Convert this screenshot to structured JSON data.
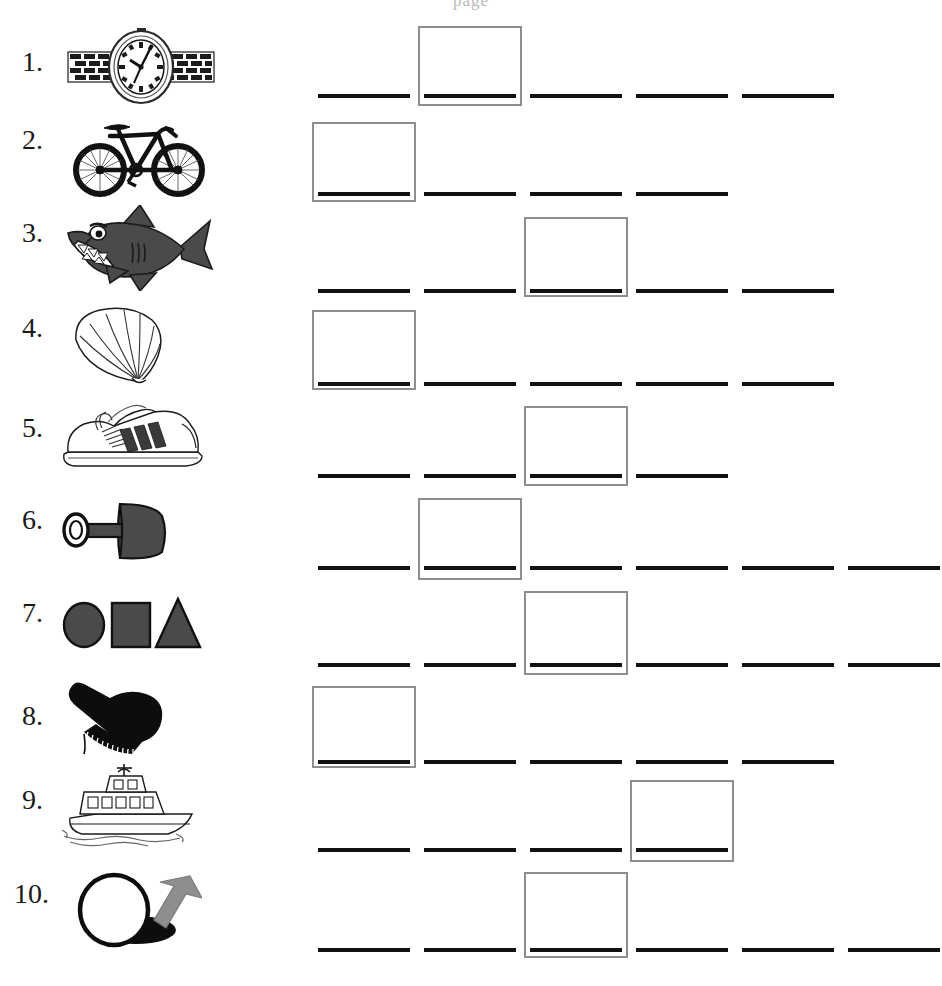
{
  "page": {
    "header_remnant": "page",
    "background_color": "#ffffff",
    "line_color": "#121212",
    "box_border_color": "#8e8e8e"
  },
  "rows": [
    {
      "number": "1.",
      "picture": "watch-illustration",
      "picture_label": "watch",
      "blank_count": 5,
      "boxed_blank_index": 2,
      "blank_widths": [
        92,
        92,
        92,
        92,
        92
      ],
      "blank_gaps": [
        14,
        14,
        14,
        14
      ]
    },
    {
      "number": "2.",
      "picture": "bicycle-illustration",
      "picture_label": "bicycle",
      "blank_count": 4,
      "boxed_blank_index": 1,
      "blank_widths": [
        92,
        92,
        92,
        92
      ],
      "blank_gaps": [
        14,
        14,
        14
      ]
    },
    {
      "number": "3.",
      "picture": "shark-illustration",
      "picture_label": "shark",
      "blank_count": 5,
      "boxed_blank_index": 3,
      "blank_widths": [
        92,
        92,
        92,
        92,
        92
      ],
      "blank_gaps": [
        14,
        14,
        14,
        14
      ]
    },
    {
      "number": "4.",
      "picture": "shell-illustration",
      "picture_label": "shell",
      "blank_count": 5,
      "boxed_blank_index": 1,
      "blank_widths": [
        92,
        92,
        92,
        92,
        92
      ],
      "blank_gaps": [
        14,
        14,
        14,
        14
      ]
    },
    {
      "number": "5.",
      "picture": "shoe-illustration",
      "picture_label": "shoe",
      "blank_count": 4,
      "boxed_blank_index": 3,
      "blank_widths": [
        92,
        92,
        92,
        92
      ],
      "blank_gaps": [
        14,
        14,
        14
      ]
    },
    {
      "number": "6.",
      "picture": "shovel-illustration",
      "picture_label": "shovel",
      "blank_count": 6,
      "boxed_blank_index": 2,
      "blank_widths": [
        92,
        92,
        92,
        92,
        92,
        92
      ],
      "blank_gaps": [
        14,
        14,
        14,
        14,
        14
      ]
    },
    {
      "number": "7.",
      "picture": "shapes-illustration",
      "picture_label": "shapes",
      "blank_count": 6,
      "boxed_blank_index": 3,
      "blank_widths": [
        92,
        92,
        92,
        92,
        92,
        92
      ],
      "blank_gaps": [
        14,
        14,
        14,
        14,
        14
      ]
    },
    {
      "number": "8.",
      "picture": "brush-illustration",
      "picture_label": "brush",
      "blank_count": 5,
      "boxed_blank_index": 1,
      "blank_widths": [
        92,
        92,
        92,
        92,
        92
      ],
      "blank_gaps": [
        14,
        14,
        14,
        14
      ]
    },
    {
      "number": "9.",
      "picture": "ship-illustration",
      "picture_label": "ship",
      "blank_count": 4,
      "boxed_blank_index": 4,
      "blank_widths": [
        92,
        92,
        92,
        92
      ],
      "blank_gaps": [
        14,
        14,
        14
      ]
    },
    {
      "number": "10.",
      "picture": "hole-illustration",
      "picture_label": "hole",
      "blank_count": 6,
      "boxed_blank_index": 3,
      "blank_widths": [
        92,
        92,
        92,
        92,
        92,
        92
      ],
      "blank_gaps": [
        14,
        14,
        14,
        14,
        14
      ]
    }
  ]
}
